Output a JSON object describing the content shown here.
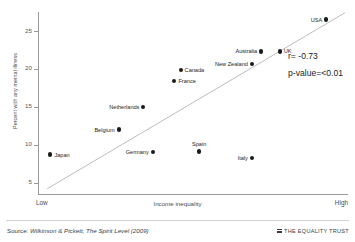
{
  "figure": {
    "title_sliver": "",
    "source_prefix": "Source: ",
    "source_text": "Wilkinson & Pickett, The Spirit Level (2009)",
    "brand_label": "THE EQUALITY TRUST",
    "brand_icon": "hamburger-bars-icon"
  },
  "chart_data": {
    "type": "scatter",
    "title": "",
    "xlabel": "Income inequality",
    "ylabel": "Percent with any mental illness",
    "x_axis_low_label": "Low",
    "x_axis_high_label": "High",
    "xlim": [
      0,
      100
    ],
    "ylim": [
      3.5,
      27.5
    ],
    "yticks": [
      5,
      10,
      15,
      20,
      25
    ],
    "ytick_labels": [
      "5",
      "10",
      "15",
      "20",
      "25"
    ],
    "grid": false,
    "legend": "none",
    "annotations": [
      {
        "name": "correlation",
        "text": "r= -0.73"
      },
      {
        "name": "p-value",
        "text": "p-value=<0.01"
      }
    ],
    "trendline": {
      "name": "linear-fit",
      "x": [
        3,
        99
      ],
      "y": [
        4.2,
        27.4
      ]
    },
    "points": [
      {
        "label": "Japan",
        "x": 4,
        "y": 8.7,
        "label_pos": "right"
      },
      {
        "label": "Belgium",
        "x": 26,
        "y": 12.0,
        "label_pos": "left"
      },
      {
        "label": "Germany",
        "x": 37,
        "y": 9.0,
        "label_pos": "left"
      },
      {
        "label": "Spain",
        "x": 52,
        "y": 9.1,
        "label_pos": "above"
      },
      {
        "label": "Italy",
        "x": 69,
        "y": 8.2,
        "label_pos": "left"
      },
      {
        "label": "Netherlands",
        "x": 34,
        "y": 15.0,
        "label_pos": "left"
      },
      {
        "label": "France",
        "x": 44,
        "y": 18.4,
        "label_pos": "right"
      },
      {
        "label": "Canada",
        "x": 46,
        "y": 19.9,
        "label_pos": "right"
      },
      {
        "label": "New Zealand",
        "x": 69,
        "y": 20.6,
        "label_pos": "left"
      },
      {
        "label": "Australia",
        "x": 72,
        "y": 22.3,
        "label_pos": "left"
      },
      {
        "label": "UK",
        "x": 78,
        "y": 22.3,
        "label_pos": "right"
      },
      {
        "label": "USA",
        "x": 93,
        "y": 26.5,
        "label_pos": "left"
      }
    ]
  }
}
